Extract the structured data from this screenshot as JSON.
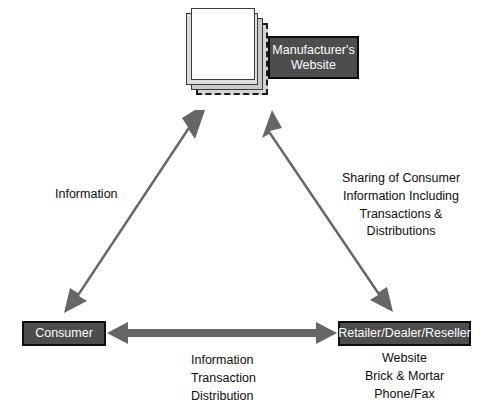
{
  "diagram": {
    "type": "triangular-flow-diagram",
    "background_color": "#ffffff",
    "arrow_color": "#666666",
    "box_fill_color": "#4d4d4d",
    "box_border_color": "#0d0d0d",
    "box_text_color": "#ffffff",
    "label_text_color": "#0d0d0d"
  },
  "nodes": {
    "manufacturer": {
      "label": "Manufacturer's\nWebsite",
      "icon": "document-stack-icon",
      "pages": 4
    },
    "consumer": {
      "label": "Consumer"
    },
    "retailer": {
      "label": "Retailer/Dealer/Reseller",
      "channels": "Website\nBrick & Mortar\nPhone/Fax"
    }
  },
  "edge_labels": {
    "consumer_to_manufacturer": "Information",
    "manufacturer_to_retailer": "Sharing of Consumer\nInformation Including\nTransactions &\nDistributions",
    "consumer_to_retailer": "Information\nTransaction\nDistribution"
  },
  "arrows": [
    {
      "name": "consumer-manufacturer-arrow",
      "from": "consumer",
      "to": "manufacturer",
      "double_headed": true
    },
    {
      "name": "manufacturer-retailer-arrow",
      "from": "manufacturer",
      "to": "retailer",
      "double_headed": true
    },
    {
      "name": "consumer-retailer-arrow",
      "from": "consumer",
      "to": "retailer",
      "double_headed": true
    }
  ]
}
